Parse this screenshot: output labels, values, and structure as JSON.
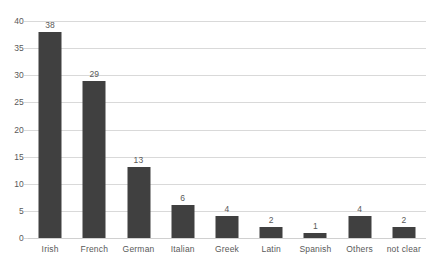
{
  "chart_data": {
    "type": "bar",
    "title": "",
    "subtitle": "",
    "xlabel": "",
    "ylabel": "",
    "categories": [
      "Irish",
      "French",
      "German",
      "Italian",
      "Greek",
      "Latin",
      "Spanish",
      "Others",
      "not clear"
    ],
    "values": [
      38,
      29,
      13,
      6,
      4,
      2,
      1,
      4,
      2
    ],
    "data_labels": [
      "38",
      "29",
      "13",
      "6",
      "4",
      "2",
      "1",
      "4",
      "2"
    ],
    "ylim": [
      0,
      40
    ],
    "ytick_step": 5,
    "ytick_labels": [
      "0",
      "5",
      "10",
      "15",
      "20",
      "25",
      "30",
      "35",
      "40"
    ],
    "grid": true,
    "grid_axis": "y",
    "legend": false,
    "legend_position": "none",
    "series": [
      {
        "name": "",
        "values": [
          38,
          29,
          13,
          6,
          4,
          2,
          1,
          4,
          2
        ]
      }
    ],
    "colors": {
      "bar": "#404040",
      "gridline": "#d9d9d9",
      "axis_text": "#595959",
      "background": "#ffffff"
    }
  }
}
